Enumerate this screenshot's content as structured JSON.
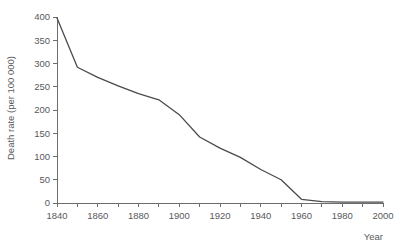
{
  "chart_data": {
    "type": "line",
    "title": "",
    "xlabel": "Year",
    "ylabel": "Death rate (per 100 000)",
    "xlim": [
      1840,
      2000
    ],
    "ylim": [
      0,
      400
    ],
    "grid": false,
    "legend": false,
    "legend_position": "none",
    "line_color": "#4b4b4d",
    "axis_color": "#6d6d6f",
    "text_color": "#59595b",
    "x_ticks": [
      1840,
      1850,
      1860,
      1870,
      1880,
      1890,
      1900,
      1910,
      1920,
      1930,
      1940,
      1950,
      1960,
      1970,
      1980,
      1990,
      2000
    ],
    "x_tick_labels": [
      "1840",
      "",
      "1860",
      "",
      "1880",
      "",
      "1900",
      "",
      "1920",
      "",
      "1940",
      "",
      "1960",
      "",
      "1980",
      "",
      "2000"
    ],
    "y_ticks": [
      0,
      50,
      100,
      150,
      200,
      250,
      300,
      350,
      400
    ],
    "y_tick_labels": [
      "0",
      "50",
      "100",
      "150",
      "200",
      "250",
      "300",
      "350",
      "400"
    ],
    "series": [
      {
        "name": "Death rate",
        "x": [
          1840,
          1850,
          1860,
          1870,
          1880,
          1890,
          1900,
          1910,
          1920,
          1930,
          1940,
          1950,
          1960,
          1970,
          1980,
          1990,
          2000
        ],
        "values": [
          398,
          292,
          270,
          252,
          235,
          222,
          190,
          142,
          118,
          98,
          72,
          50,
          8,
          3,
          2,
          2,
          2
        ]
      }
    ]
  }
}
